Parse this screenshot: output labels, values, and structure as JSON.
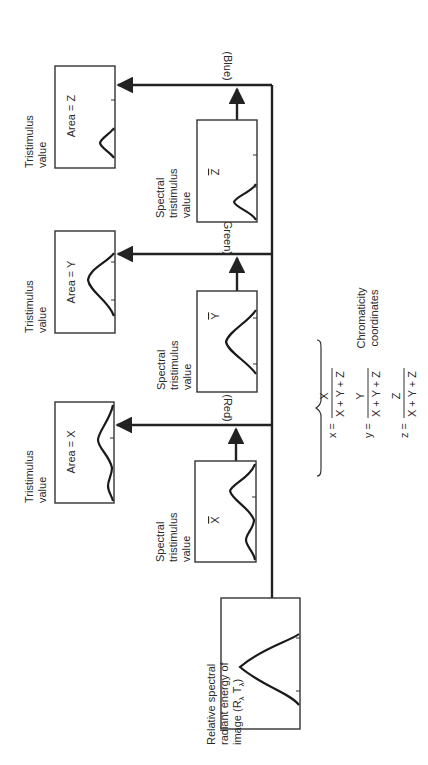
{
  "diagram": {
    "source": {
      "label_lines": [
        "Relative spectral",
        "radiant energy of",
        "image (R",
        "λ",
        " T",
        "λ",
        ")"
      ],
      "line1": "Relative spectral",
      "line2": "radiant energy of",
      "line3_prefix": "image (R",
      "line3_sub1": "λ",
      "line3_mid": " T",
      "line3_sub2": "λ",
      "line3_suffix": ")"
    },
    "spectral_label": {
      "line1": "Spectral",
      "line2": "tristimulus",
      "line3": "value"
    },
    "tristimulus_label": {
      "line1": "Tristimulus",
      "line2": "value"
    },
    "channels": [
      {
        "name": "red",
        "label": "(Red)",
        "spectral_symbol": "X",
        "area_label": "Area = X"
      },
      {
        "name": "green",
        "label": "(Green)",
        "spectral_symbol": "Y",
        "area_label": "Area = Y"
      },
      {
        "name": "blue",
        "label": "(Blue)",
        "spectral_symbol": "Z",
        "area_label": "Area = Z"
      }
    ],
    "chromaticity": {
      "title_line1": "Chromaticity",
      "title_line2": "coordinates",
      "equations": [
        {
          "lhs": "x =",
          "numerator": "X",
          "denominator": "X + Y + Z"
        },
        {
          "lhs": "y =",
          "numerator": "Y",
          "denominator": "X + Y + Z"
        },
        {
          "lhs": "z =",
          "numerator": "Z",
          "denominator": "X + Y + Z"
        }
      ]
    }
  },
  "colors": {
    "line": "#222222",
    "text": "#2a2a2a",
    "background": "#ffffff"
  }
}
